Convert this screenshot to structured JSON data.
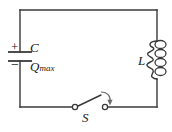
{
  "figure": {
    "name": "lc-circuit-diagram",
    "background_color": "#ffffff",
    "wire_color": "#3a3a3a",
    "label_color": "#1a1a1a"
  },
  "labels": {
    "capacitor": "C",
    "charge_symbol": "Q",
    "charge_subscript": "max",
    "inductor": "L",
    "switch": "S",
    "plus_sign": "+",
    "minus_sign": "−"
  },
  "components": {
    "capacitor": {
      "name": "capacitor",
      "label": "C",
      "charge_label": "Qmax",
      "polarity_top": "+",
      "polarity_bottom": "−",
      "position": "left-branch"
    },
    "inductor": {
      "name": "inductor",
      "label": "L",
      "coil_turns": 4,
      "position": "right-branch"
    },
    "switch": {
      "name": "switch",
      "label": "S",
      "state": "open",
      "position": "bottom-branch",
      "closing_arrow": true
    }
  },
  "circuit": {
    "type": "LC oscillator loop",
    "loop": {
      "left_x": 20,
      "right_x": 157,
      "top_y": 10,
      "bottom_y": 107
    }
  }
}
